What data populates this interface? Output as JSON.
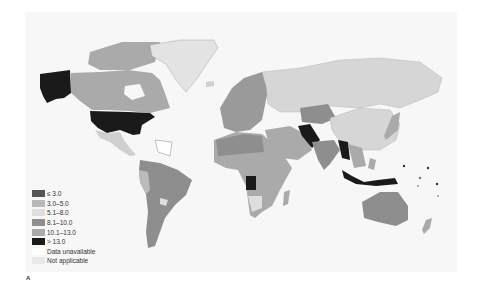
{
  "panel_label": "A",
  "legend": {
    "items": [
      {
        "label": "≤ 3.0",
        "color": "#555555"
      },
      {
        "label": "3.0–5.0",
        "color": "#b9b9b9"
      },
      {
        "label": "5.1–8.0",
        "color": "#dedede"
      },
      {
        "label": "8.1–10.0",
        "color": "#8e8e8e"
      },
      {
        "label": "10.1–13.0",
        "color": "#aaaaaa"
      },
      {
        "label": "> 13.0",
        "color": "#1a1a1a"
      },
      {
        "label": "Data unavailable",
        "color": "#ffffff"
      },
      {
        "label": "Not applicable",
        "color": "#e8e8e8"
      }
    ]
  },
  "colors": {
    "background_box": "#f7f7f7",
    "land_default": "#d6d6d6"
  }
}
